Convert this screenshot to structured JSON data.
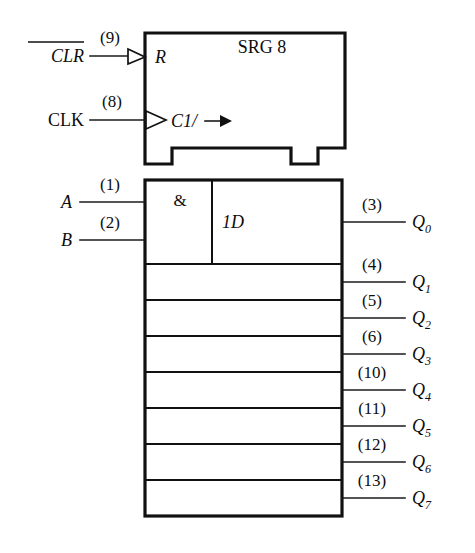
{
  "diagram": {
    "title": "SRG 8",
    "kind": "ieee-ansi-shift-register-symbol",
    "control_block": {
      "label": "SRG 8",
      "reset_label": "R",
      "clock_label": "C1/",
      "clock_arrow": "→"
    },
    "array_block": {
      "and_cell_label": "&",
      "data_cell_label": "1D"
    },
    "inputs": [
      {
        "name": "CLR",
        "display": "CLR",
        "overbar": true,
        "pin": "(9)",
        "port": "R",
        "active_low": true
      },
      {
        "name": "CLK",
        "display": "CLK",
        "overbar": false,
        "pin": "(8)",
        "port": "C1/",
        "active_low": false
      },
      {
        "name": "A",
        "display": "A",
        "overbar": false,
        "pin": "(1)",
        "port": "&",
        "active_low": false
      },
      {
        "name": "B",
        "display": "B",
        "overbar": false,
        "pin": "(2)",
        "port": "&",
        "active_low": false
      }
    ],
    "outputs": [
      {
        "base": "Q",
        "sub": "0",
        "pin": "(3)"
      },
      {
        "base": "Q",
        "sub": "1",
        "pin": "(4)"
      },
      {
        "base": "Q",
        "sub": "2",
        "pin": "(5)"
      },
      {
        "base": "Q",
        "sub": "3",
        "pin": "(6)"
      },
      {
        "base": "Q",
        "sub": "4",
        "pin": "(10)"
      },
      {
        "base": "Q",
        "sub": "5",
        "pin": "(11)"
      },
      {
        "base": "Q",
        "sub": "6",
        "pin": "(12)"
      },
      {
        "base": "Q",
        "sub": "7",
        "pin": "(13)"
      }
    ],
    "colors": {
      "ink": "#111111",
      "background": "#ffffff"
    }
  }
}
